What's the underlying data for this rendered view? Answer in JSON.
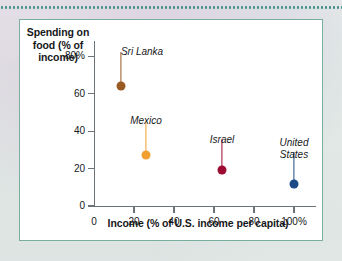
{
  "page": {
    "background_color": "#eef3f1",
    "frame_border_color": "#79ad9f",
    "top_rule_color": "#3f8f86",
    "plot_background": "#ffffff",
    "axis_color": "#6d7479",
    "text_color": "#16181a"
  },
  "chart_data": {
    "type": "scatter",
    "title": "",
    "xlabel": "Income (% of U.S. income per capita)",
    "ylabel": "Spending on food (% of income)",
    "ylabel_lines": [
      "Spending on",
      "food (% of",
      "income)"
    ],
    "xlim": [
      0,
      112
    ],
    "ylim": [
      0,
      88
    ],
    "grid": false,
    "legend": "none",
    "xticks": [
      0,
      20,
      40,
      60,
      80,
      100
    ],
    "xtick_labels": [
      "0",
      "20",
      "40",
      "60",
      "80",
      "100%"
    ],
    "yticks": [
      0,
      20,
      40,
      60,
      80
    ],
    "ytick_labels": [
      "0",
      "20",
      "40",
      "60",
      "80%"
    ],
    "points": [
      {
        "label": "Sri Lanka",
        "x": 13.5,
        "y": 64,
        "color": "#9a5a23",
        "label_offset_x": 21,
        "label_offset_y": -40,
        "leader_length": 30
      },
      {
        "label": "Mexico",
        "x": 26,
        "y": 27.5,
        "color": "#f0a030",
        "label_offset_x": 0,
        "label_offset_y": -40,
        "leader_length": 30
      },
      {
        "label": "Israel",
        "x": 64,
        "y": 19,
        "color": "#9e0b32",
        "label_offset_x": 0,
        "label_offset_y": -36,
        "leader_length": 27
      },
      {
        "label": "United\nStates",
        "x": 100,
        "y": 11.5,
        "color": "#1b4a86",
        "label_offset_x": 0,
        "label_offset_y": -47,
        "leader_length": 28
      }
    ]
  }
}
